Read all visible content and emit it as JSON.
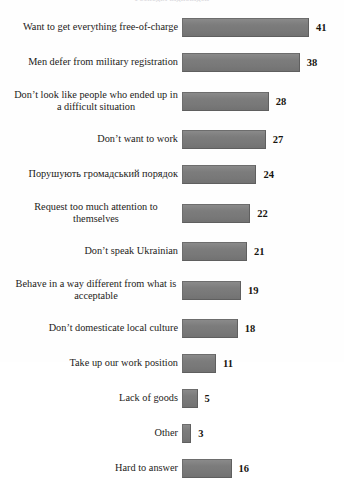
{
  "figure": {
    "clipped_heading": "Розподіл відповідей",
    "bar_color": "#7d7d7d",
    "background_color": "#fefefe",
    "text_color": "#1d1b19"
  },
  "chart_data": {
    "type": "bar",
    "orientation": "horizontal",
    "title": "",
    "xlabel": "",
    "ylabel": "",
    "xlim": [
      0,
      41
    ],
    "grid": false,
    "legend": false,
    "categories": [
      "Want to get everything free-of-charge",
      "Men defer from military registration",
      "Don’t look like people who ended up in a difficult situation",
      "Don’t want to work",
      "Порушують громадський порядок",
      "Request too much attention to themselves",
      "Don’t speak Ukrainian",
      "Behave in a way different from what is acceptable",
      "Don’t domesticate local culture",
      "Take up our work position",
      "Lack of goods",
      "Other",
      "Hard to answer"
    ],
    "values": [
      41,
      38,
      28,
      27,
      24,
      22,
      21,
      19,
      18,
      11,
      5,
      3,
      16
    ]
  },
  "rows": [
    {
      "label": "Want to get everything free-of-charge",
      "value": "41",
      "width": 41,
      "lines": 1
    },
    {
      "label": "Men defer from military registration",
      "value": "38",
      "width": 38,
      "lines": 1
    },
    {
      "label": "Don’t look like people who ended up in a difficult situation",
      "value": "28",
      "width": 28,
      "lines": 2
    },
    {
      "label": "Don’t want to work",
      "value": "27",
      "width": 27,
      "lines": 1
    },
    {
      "label": "Порушують громадський порядок",
      "value": "24",
      "width": 24,
      "lines": 1
    },
    {
      "label": "Request too much attention to themselves",
      "value": "22",
      "width": 22,
      "lines": 2
    },
    {
      "label": "Don’t speak Ukrainian",
      "value": "21",
      "width": 21,
      "lines": 1
    },
    {
      "label": "Behave in a way different from what is acceptable",
      "value": "19",
      "width": 19,
      "lines": 2
    },
    {
      "label": "Don’t domesticate local culture",
      "value": "18",
      "width": 18,
      "lines": 1
    },
    {
      "label": "Take up our work position",
      "value": "11",
      "width": 11,
      "lines": 1
    },
    {
      "label": "Lack of goods",
      "value": "5",
      "width": 5,
      "lines": 1
    },
    {
      "label": "Other",
      "value": "3",
      "width": 3,
      "lines": 1
    },
    {
      "label": "Hard to answer",
      "value": "16",
      "width": 16,
      "lines": 1
    }
  ]
}
